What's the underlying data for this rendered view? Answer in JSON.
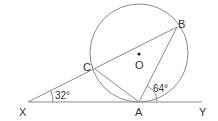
{
  "diagram": {
    "type": "circle-geometry",
    "points": {
      "X": {
        "label": "X"
      },
      "Y": {
        "label": "Y"
      },
      "A": {
        "label": "A"
      },
      "B": {
        "label": "B"
      },
      "C": {
        "label": "C"
      },
      "O": {
        "label": "O"
      }
    },
    "angles": {
      "at_X": "32°",
      "at_A": "64°"
    },
    "colors": {
      "line": "#8a8a8a",
      "text": "#333333"
    }
  }
}
